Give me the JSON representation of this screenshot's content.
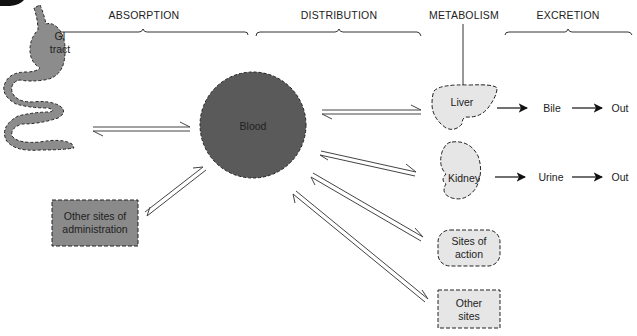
{
  "headers": {
    "absorption": "ABSORPTION",
    "distribution": "DISTRIBUTION",
    "metabolism": "METABOLISM",
    "excretion": "EXCRETION"
  },
  "nodes": {
    "gi_tract": "GI tract",
    "gi_line1": "GI",
    "gi_line2": "tract",
    "other_admin_line1": "Other sites of",
    "other_admin_line2": "administration",
    "blood": "Blood",
    "liver": "Liver",
    "kidney": "Kidney",
    "sites_action_line1": "Sites of",
    "sites_action_line2": "action",
    "other_sites_line1": "Other",
    "other_sites_line2": "sites",
    "bile": "Bile",
    "urine": "Urine",
    "out_bile": "Out",
    "out_urine": "Out"
  },
  "colors": {
    "blood_fill": "#5a5a5a",
    "gi_fill": "#8c8c8c",
    "admin_fill": "#8a8a8a",
    "organ_fill": "#e6e6e6",
    "line": "#333333"
  }
}
